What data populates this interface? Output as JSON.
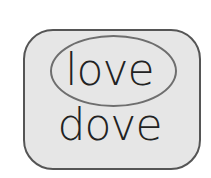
{
  "diagram": {
    "words": [
      "love",
      "dove"
    ],
    "highlighted_word": "love",
    "colors": {
      "box_fill": "#e6e6e6",
      "box_border": "#555555",
      "ellipse_border": "#6e6e6e",
      "text": "#222222"
    }
  }
}
